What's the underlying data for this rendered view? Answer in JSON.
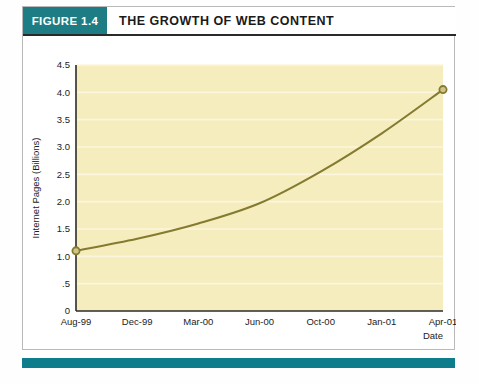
{
  "figure": {
    "badge_label": "FIGURE 1.4",
    "title": "THE GROWTH OF WEB CONTENT"
  },
  "colors": {
    "badge_teal": "#1d7c84",
    "rule_teal": "#0d7d8c",
    "plot_background": "#f5edbe",
    "line": "#847b30",
    "marker_fill": "#cfc48a",
    "gridline": "#fbf6dd",
    "axis": "#2b2b2b"
  },
  "chart_data": {
    "type": "line",
    "title": "THE GROWTH OF WEB CONTENT",
    "xlabel": "Date",
    "ylabel": "Internet Pages (Billions)",
    "grid": true,
    "legend": "none",
    "ylim": [
      0,
      4.5
    ],
    "yticks": [
      0,
      0.5,
      1.0,
      1.5,
      2.0,
      2.5,
      3.0,
      3.5,
      4.0,
      4.5
    ],
    "ytick_labels": [
      "0",
      ".5",
      "1.0",
      "1.5",
      "2.0",
      "2.5",
      "3.0",
      "3.5",
      "4.0",
      "4.5"
    ],
    "categories": [
      "Aug-99",
      "Dec-99",
      "Mar-00",
      "Jun-00",
      "Oct-00",
      "Jan-01",
      "Apr-01"
    ],
    "xtick_labels": [
      "Aug-99",
      "Dec-99",
      "Mar-00",
      "Jun-00",
      "Oct-00",
      "Jan-01",
      "Apr-01"
    ],
    "series": [
      {
        "name": "Internet Pages",
        "points": [
          {
            "x": "Aug-99",
            "y": 1.1
          },
          {
            "x": "Dec-99",
            "y": 1.32
          },
          {
            "x": "Mar-00",
            "y": 1.6
          },
          {
            "x": "Jun-00",
            "y": 1.97
          },
          {
            "x": "Oct-00",
            "y": 2.55
          },
          {
            "x": "Jan-01",
            "y": 3.25
          },
          {
            "x": "Apr-01",
            "y": 4.05
          }
        ],
        "markers": [
          {
            "x": "Aug-99",
            "y": 1.1
          },
          {
            "x": "Apr-01",
            "y": 4.05
          }
        ]
      }
    ]
  },
  "caption": {
    "clipped_line": ""
  }
}
